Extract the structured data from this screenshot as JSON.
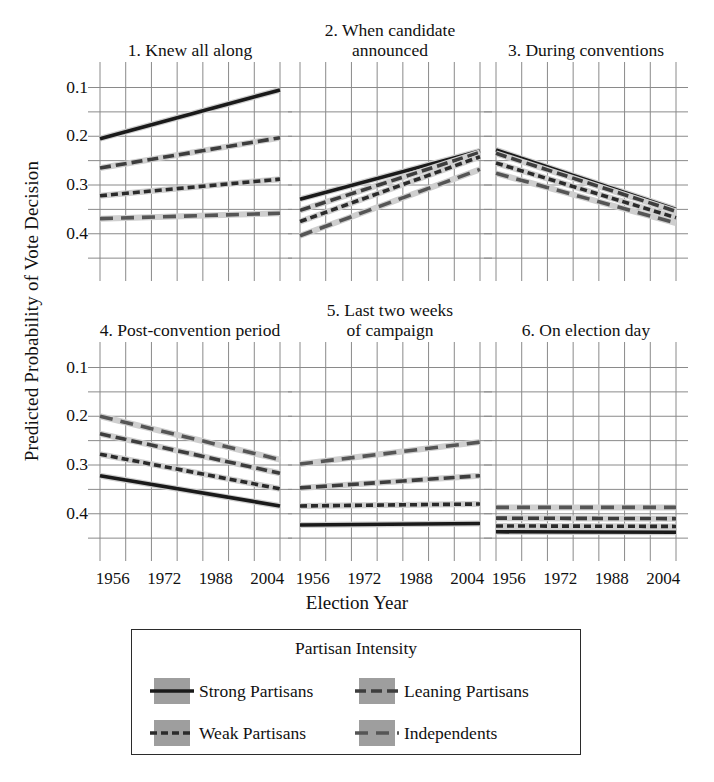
{
  "figure": {
    "ylabel": "Predicted Probability of Vote Decision",
    "xlabel": "Election Year"
  },
  "legend": {
    "title": "Partisan Intensity",
    "items": [
      {
        "label": "Strong Partisans",
        "key": "strong",
        "color": "#1a1a1a",
        "dash": "solid"
      },
      {
        "label": "Leaning Partisans",
        "key": "leaning",
        "color": "#3d3d3d",
        "dash": "long-dash"
      },
      {
        "label": "Weak Partisans",
        "key": "weak",
        "color": "#2b2b2b",
        "dash": "short-dash"
      },
      {
        "label": "Independents",
        "key": "independents",
        "color": "#555555",
        "dash": "wide-dash"
      }
    ]
  },
  "chart_data": {
    "type": "line",
    "title": "",
    "xlabel": "Election Year",
    "ylabel": "Predicted Probability of Vote Decision",
    "x": [
      1952,
      1956,
      1960,
      1964,
      1968,
      1972,
      1976,
      1980,
      1984,
      1988,
      1992,
      1996,
      2000,
      2004,
      2008
    ],
    "xticks": [
      1956,
      1972,
      1988,
      2004
    ],
    "xlim": [
      1952,
      2008
    ],
    "yticks": [
      0.1,
      0.2,
      0.3,
      0.4
    ],
    "ylim": [
      0.04,
      0.44
    ],
    "grid": true,
    "legend_position": "below-figure",
    "series_names": [
      "Strong Partisans",
      "Leaning Partisans",
      "Weak Partisans",
      "Independents"
    ],
    "panels": [
      {
        "index": 1,
        "title": "1. Knew all along",
        "series": [
          {
            "name": "Strong Partisans",
            "endpoints": [
              0.295,
              0.395
            ]
          },
          {
            "name": "Leaning Partisans",
            "endpoints": [
              0.235,
              0.297
            ]
          },
          {
            "name": "Weak Partisans",
            "endpoints": [
              0.178,
              0.212
            ]
          },
          {
            "name": "Independents",
            "endpoints": [
              0.131,
              0.142
            ]
          }
        ]
      },
      {
        "index": 2,
        "title": "2. When candidate\nannounced",
        "series": [
          {
            "name": "Strong Partisans",
            "endpoints": [
              0.171,
              0.27
            ]
          },
          {
            "name": "Leaning Partisans",
            "endpoints": [
              0.148,
              0.267
            ]
          },
          {
            "name": "Weak Partisans",
            "endpoints": [
              0.125,
              0.258
            ]
          },
          {
            "name": "Independents",
            "endpoints": [
              0.096,
              0.232
            ]
          }
        ]
      },
      {
        "index": 3,
        "title": "3. During conventions",
        "series": [
          {
            "name": "Strong Partisans",
            "endpoints": [
              0.272,
              0.15
            ]
          },
          {
            "name": "Leaning Partisans",
            "endpoints": [
              0.265,
              0.146
            ]
          },
          {
            "name": "Weak Partisans",
            "endpoints": [
              0.245,
              0.133
            ]
          },
          {
            "name": "Independents",
            "endpoints": [
              0.224,
              0.122
            ]
          }
        ]
      },
      {
        "index": 4,
        "title": "4. Post-convention period",
        "series": [
          {
            "name": "Strong Partisans",
            "endpoints": [
              0.178,
              0.116
            ]
          },
          {
            "name": "Leaning Partisans",
            "endpoints": [
              0.264,
              0.183
            ]
          },
          {
            "name": "Weak Partisans",
            "endpoints": [
              0.222,
              0.151
            ]
          },
          {
            "name": "Independents",
            "endpoints": [
              0.3,
              0.211
            ]
          }
        ]
      },
      {
        "index": 5,
        "title": "5. Last two weeks\nof campaign",
        "series": [
          {
            "name": "Strong Partisans",
            "endpoints": [
              0.077,
              0.08
            ]
          },
          {
            "name": "Leaning Partisans",
            "endpoints": [
              0.153,
              0.178
            ]
          },
          {
            "name": "Weak Partisans",
            "endpoints": [
              0.116,
              0.12
            ]
          },
          {
            "name": "Independents",
            "endpoints": [
              0.202,
              0.247
            ]
          }
        ]
      },
      {
        "index": 6,
        "title": "6. On election day",
        "series": [
          {
            "name": "Strong Partisans",
            "endpoints": [
              0.063,
              0.062
            ]
          },
          {
            "name": "Leaning Partisans",
            "endpoints": [
              0.091,
              0.09
            ]
          },
          {
            "name": "Weak Partisans",
            "endpoints": [
              0.075,
              0.074
            ]
          },
          {
            "name": "Independents",
            "endpoints": [
              0.113,
              0.113
            ]
          }
        ]
      }
    ]
  },
  "axes": {
    "ytick_labels": [
      "0.4",
      "0.3",
      "0.2",
      "0.1"
    ],
    "xtick_labels": [
      "1956",
      "1972",
      "1988",
      "2004"
    ]
  }
}
